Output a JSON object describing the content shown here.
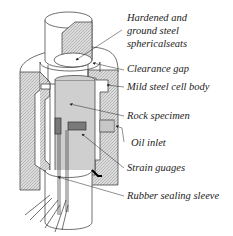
{
  "figure": {
    "labels": {
      "seats_line1": "Hardened and",
      "seats_line2": "ground steel",
      "seats_line3": "sphericalseats",
      "clearance_gap": "Clearance gap",
      "cell_body": "Mild steel cell body",
      "rock_specimen": "Rock specimen",
      "oil_inlet": "Oil inlet",
      "strain_gauges": "Strain guages",
      "sealing_sleeve": "Rubber sealing sleeve"
    },
    "colors": {
      "outline": "#333333",
      "hatch_fill": "#d6d6d6",
      "specimen_fill": "#c8c8c8",
      "gauge_fill": "#7a7a7a",
      "background": "#ffffff"
    }
  }
}
